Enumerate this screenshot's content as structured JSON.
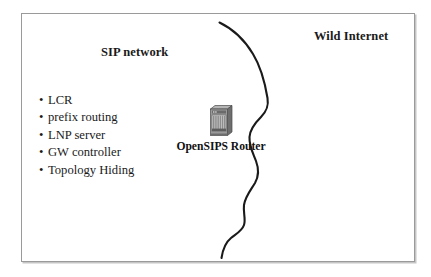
{
  "slide": {
    "background_color": "#ffffff",
    "border_color": "#9a9a9a"
  },
  "zones": {
    "left": {
      "title": "SIP network"
    },
    "right": {
      "title": "Wild Internet"
    }
  },
  "features": {
    "bullet_glyph": "•",
    "items": [
      {
        "label": "LCR"
      },
      {
        "label": "prefix routing"
      },
      {
        "label": "LNP server"
      },
      {
        "label": "GW controller"
      },
      {
        "label": "Topology Hiding"
      }
    ]
  },
  "router": {
    "label": "OpenSIPS Router",
    "icon": "router-chassis-icon",
    "icon_colors": {
      "body": "#8f8f8f",
      "front": "#c9c9c9",
      "shade": "#6e6e6e",
      "outline": "#4a4a4a"
    }
  },
  "boundary": {
    "name": "hand-drawn-network-boundary",
    "color": "#1a1a1a"
  }
}
